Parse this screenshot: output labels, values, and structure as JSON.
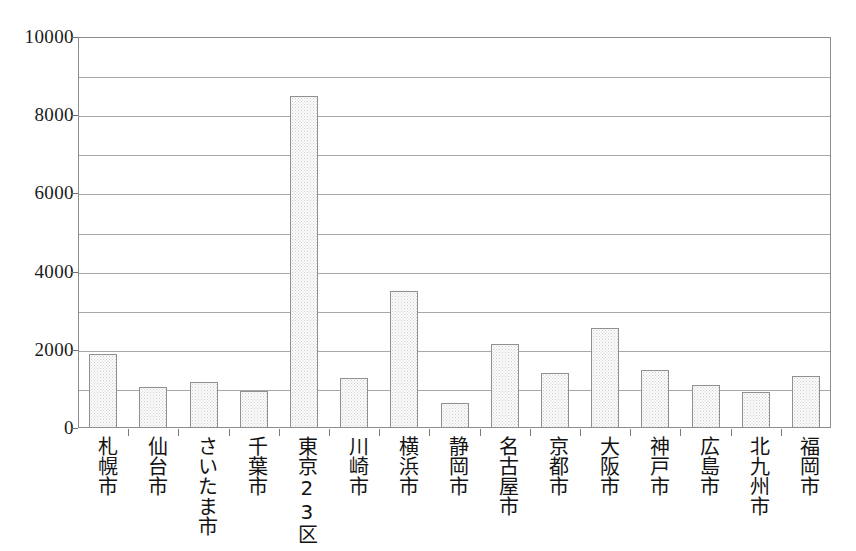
{
  "chart_data": {
    "type": "bar",
    "title": "",
    "subtitle": "",
    "xlabel": "",
    "ylabel": "",
    "ylim": [
      0,
      10000
    ],
    "grid": true,
    "legend": "none",
    "y_major_step": 2000,
    "y_grid_step": 1000,
    "y_tick_labels": [
      "10000",
      "8000",
      "6000",
      "4000",
      "2000",
      "0"
    ],
    "y_tick_values": [
      10000,
      8000,
      6000,
      4000,
      2000,
      0
    ],
    "categories": [
      "札幌市",
      "仙台市",
      "さいたま市",
      "千葉市",
      "東京23区",
      "川崎市",
      "横浜市",
      "静岡市",
      "名古屋市",
      "京都市",
      "大阪市",
      "神戸市",
      "広島市",
      "北九州市",
      "福岡市"
    ],
    "values": [
      1900,
      1050,
      1180,
      950,
      8500,
      1280,
      3500,
      640,
      2150,
      1400,
      2570,
      1490,
      1090,
      930,
      1340
    ],
    "colors": {
      "bar_fill": "#fcfcfc",
      "bar_pattern": "#cfcfcf",
      "bar_border": "#909090",
      "gridline": "#a8a8a8",
      "frame": "#8d8d8d",
      "text": "#131313",
      "background": "#ffffff"
    }
  }
}
